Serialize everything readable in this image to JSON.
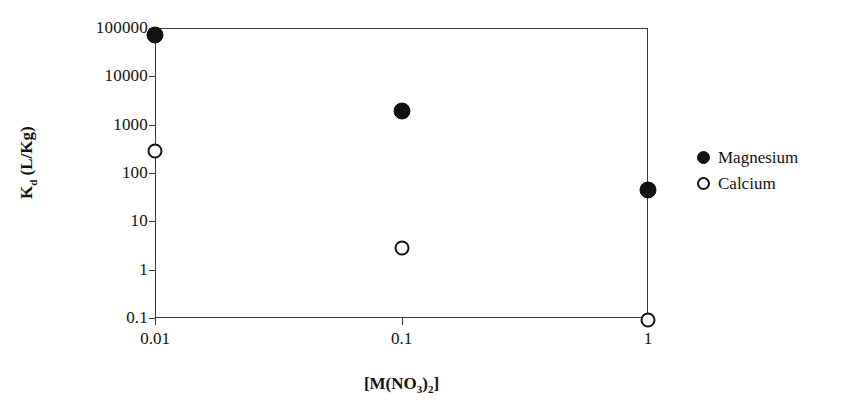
{
  "chart_data": {
    "type": "scatter",
    "title": "",
    "xlabel": "[M(NO3)2]",
    "xlabel_html": "[M(NO<sub>3</sub>)<sub>2</sub>]",
    "ylabel": "Kd (L/Kg)",
    "ylabel_html": "K<sub>d</sub> (L/Kg)",
    "xscale": "log",
    "yscale": "log",
    "xlim": [
      0.01,
      1
    ],
    "ylim": [
      0.1,
      100000
    ],
    "grid": false,
    "legend_position": "right",
    "x_tick_labels": [
      "0.01",
      "0.1",
      "1"
    ],
    "x_tick_values": [
      0.01,
      0.1,
      1
    ],
    "y_tick_labels": [
      "0.1",
      "1",
      "10",
      "100",
      "1000",
      "10000",
      "100000"
    ],
    "y_tick_values": [
      0.1,
      1,
      10,
      100,
      1000,
      10000,
      100000
    ],
    "series": [
      {
        "name": "Magnesium",
        "marker": "filled-circle",
        "color": "#111111",
        "x": [
          0.01,
          0.1,
          1
        ],
        "values": [
          70000,
          1900,
          45
        ]
      },
      {
        "name": "Calcium",
        "marker": "open-circle",
        "color": "#111111",
        "x": [
          0.01,
          0.1,
          1
        ],
        "values": [
          280,
          2.8,
          0.09
        ]
      }
    ]
  },
  "legend": {
    "items": [
      {
        "label": "Magnesium",
        "marker": "filled-circle"
      },
      {
        "label": "Calcium",
        "marker": "open-circle"
      }
    ]
  }
}
